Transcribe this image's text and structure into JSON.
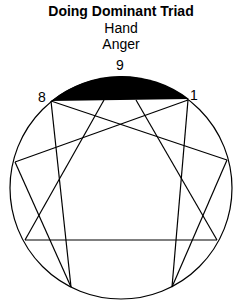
{
  "diagram": {
    "title": "Doing Dominant Triad",
    "center": "Hand",
    "emotion": "Anger",
    "point_labels": {
      "nine": "9",
      "eight": "8",
      "one": "1"
    },
    "highlighted_segment": [
      "8",
      "9",
      "1"
    ],
    "fill_color": "#000000"
  }
}
